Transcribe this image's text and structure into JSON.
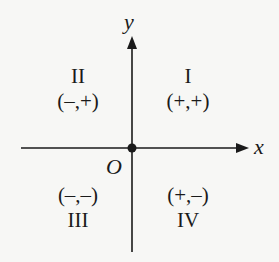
{
  "diagram": {
    "axes": {
      "x_label": "x",
      "y_label": "y",
      "origin_label": "O"
    },
    "quadrants": [
      {
        "numeral": "I",
        "signs": "(+,+)"
      },
      {
        "numeral": "II",
        "signs": "(–,+)"
      },
      {
        "numeral": "III",
        "signs": "(–,–)"
      },
      {
        "numeral": "IV",
        "signs": "(+,–)"
      }
    ],
    "colors": {
      "background": "#f7f7f5",
      "ink": "#1a1a1a"
    }
  }
}
